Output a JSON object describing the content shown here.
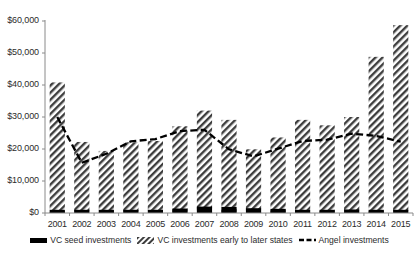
{
  "chart_data": {
    "type": "bar",
    "title": "",
    "xlabel": "",
    "ylabel": "",
    "ylim": [
      0,
      60000
    ],
    "grid": false,
    "legend_position": "bottom",
    "categories": [
      "2001",
      "2002",
      "2003",
      "2004",
      "2005",
      "2006",
      "2007",
      "2008",
      "2009",
      "2010",
      "2011",
      "2012",
      "2013",
      "2014",
      "2015"
    ],
    "ytick_labels": [
      "$0",
      "$10,000",
      "$20,000",
      "$30,000",
      "$40,000",
      "$50,000",
      "$60,000"
    ],
    "ytick_values": [
      0,
      10000,
      20000,
      30000,
      40000,
      50000,
      60000
    ],
    "series": [
      {
        "name": "VC seed investments",
        "type": "bar",
        "style": "solid-black",
        "color": "#000000",
        "values": [
          900,
          600,
          500,
          700,
          700,
          1400,
          2000,
          1900,
          1500,
          1300,
          800,
          800,
          1100,
          900,
          1000
        ]
      },
      {
        "name": "VC investments early to later states",
        "type": "bar",
        "style": "diagonal-hatch",
        "color": "#4a4a4a",
        "values": [
          40800,
          22200,
          19400,
          22100,
          22500,
          27100,
          32000,
          29100,
          19900,
          23600,
          29100,
          27400,
          30000,
          48800,
          58700
        ]
      },
      {
        "name": "Angel investments",
        "type": "line",
        "style": "dashed",
        "color": "#000000",
        "values": [
          30000,
          15700,
          18500,
          22400,
          23100,
          25600,
          26000,
          19900,
          17700,
          20100,
          22500,
          22900,
          24800,
          24100,
          22300
        ]
      }
    ]
  },
  "legend": {
    "entries": [
      {
        "label": "VC seed investments",
        "marker": "solid-bar-swatch"
      },
      {
        "label": "VC investments early to later states",
        "marker": "hatch-bar-swatch"
      },
      {
        "label": "Angel investments",
        "marker": "dashed-line-swatch"
      }
    ]
  }
}
